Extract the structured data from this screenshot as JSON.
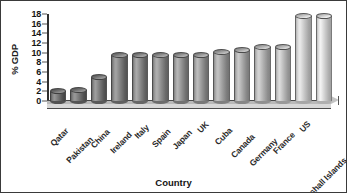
{
  "chart_data": {
    "type": "bar",
    "title": "",
    "subtitle": "",
    "xlabel": "Country",
    "ylabel": "% GDP",
    "ylim": [
      0,
      18
    ],
    "yticks": [
      0,
      2,
      4,
      6,
      8,
      10,
      12,
      14,
      16,
      18
    ],
    "ytick_labels": [
      "0",
      "2",
      "4",
      "6",
      "8",
      "10",
      "12",
      "14",
      "16",
      "18"
    ],
    "grid": false,
    "legend": null,
    "legend_position": "none",
    "style": "3d-cylinder-grayscale",
    "categories": [
      "Qatar",
      "Pakistan",
      "China",
      "Ireland",
      "Italy",
      "Spain",
      "Japan",
      "UK",
      "Cuba",
      "Canada",
      "Germany",
      "France",
      "US",
      "Marshall Islands"
    ],
    "values": [
      2.0,
      2.2,
      5.0,
      9.5,
      9.6,
      9.6,
      9.6,
      9.6,
      10.2,
      10.6,
      11.2,
      11.2,
      17.6,
      17.6
    ],
    "bar_shades": [
      "#6e6e6e",
      "#717171",
      "#767676",
      "#7c7c7c",
      "#828282",
      "#888888",
      "#8e8e8e",
      "#949494",
      "#9b9b9b",
      "#a3a3a3",
      "#acacac",
      "#b5b5b5",
      "#c3c3c3",
      "#cbcbcb"
    ]
  },
  "figure": {
    "border_color": "#3a3a3a",
    "background": "#ffffff",
    "axis_color": "#2e2e2e",
    "floor_color": "#c8c8c8"
  }
}
